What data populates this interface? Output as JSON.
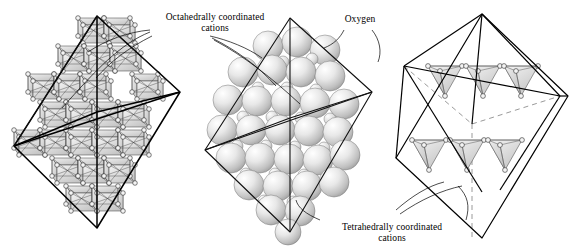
{
  "figure": {
    "name": "spinel-crystal-structure",
    "panel_count": 3,
    "background_color": "#ffffff",
    "line_color": "#000000",
    "polyhedron_fill_light": "#f2f2f2",
    "polyhedron_fill_dark": "#c9c9c9",
    "sphere_fill_light": "#ffffff",
    "sphere_fill_dark": "#b4b4b4",
    "atom_node_fill": "#f4f4f4"
  },
  "labels": {
    "octahedral": "Octahedrally coordinated\ncations",
    "oxygen": "Oxygen",
    "tetrahedral": "Tetrahedrally coordinated\ncations"
  },
  "panels": [
    {
      "id": "left",
      "name": "octahedral-polyhedra-panel",
      "description": "Octahedral unit-cell outline filled with rows of edge-sharing coordination octahedra",
      "outline_shape": "octahedron",
      "polyhedron_type": "octahedron",
      "polyhedron_rows": [
        2,
        3,
        4,
        3,
        2
      ],
      "center_x": 97,
      "center_y": 126
    },
    {
      "id": "middle",
      "name": "oxygen-close-packing-panel",
      "description": "Space-filling model of close-packed oxygen spheres with smaller interstitial cations",
      "outline_shape": "octahedron",
      "sphere_rows": 6,
      "large_sphere_radius": 15,
      "small_sphere_radius": 6,
      "center_x": 290,
      "center_y": 126
    },
    {
      "id": "right",
      "name": "tetrahedral-polyhedra-panel",
      "description": "Octahedral unit-cell outline with dashed hidden edges containing two rows of coordination tetrahedra",
      "outline_shape": "octahedron",
      "polyhedron_type": "tetrahedron",
      "tetrahedra_rows": 2,
      "tetrahedra_per_row": 3,
      "hidden_edges": "dashed",
      "center_x": 482,
      "center_y": 126
    }
  ]
}
